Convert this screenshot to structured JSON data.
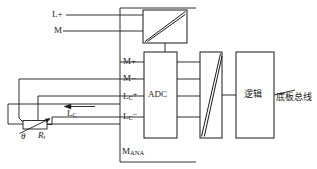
{
  "figure": {
    "kind": "electrical-schematic",
    "background_color": "#ffffff",
    "line_color": "#1a1a1a"
  },
  "blocks": {
    "power_isolation": {
      "label": "",
      "symbol": "diagonal-isolation",
      "x": 143,
      "y": 10,
      "w": 44,
      "h": 33
    },
    "adc": {
      "label": "ADC",
      "x": 144,
      "y": 52,
      "w": 33,
      "h": 86
    },
    "signal_isolation": {
      "label": "",
      "symbol": "diagonal-isolation",
      "x": 200,
      "y": 52,
      "w": 22,
      "h": 86
    },
    "logic": {
      "label": "逻辑",
      "x": 236,
      "y": 52,
      "w": 38,
      "h": 86
    }
  },
  "supply_terminals": [
    {
      "name": "l-plus",
      "label": "L+",
      "x": 52,
      "y": 10
    },
    {
      "name": "m-ground",
      "label": "M",
      "x": 52,
      "y": 26
    }
  ],
  "adc_terminals": [
    {
      "name": "m-plus",
      "label": "M+",
      "sup": "",
      "sub": "",
      "x": 120,
      "y": 57
    },
    {
      "name": "m-minus",
      "label": "M−",
      "sup": "",
      "sub": "",
      "x": 120,
      "y": 74
    },
    {
      "name": "lc-plus",
      "label": "L",
      "sub": "C",
      "sup": "+",
      "x": 120,
      "y": 91
    },
    {
      "name": "lc-minus",
      "label": "L",
      "sub": "C",
      "sup": "−",
      "x": 120,
      "y": 111
    }
  ],
  "labels": {
    "analog_ground": {
      "base": "M",
      "sub": "ANA",
      "x": 122,
      "y": 147
    },
    "current_arrow": {
      "base": "L",
      "sub": "C",
      "x": 67,
      "y": 113
    },
    "backplane_bus": {
      "text": "底板总线",
      "x": 276,
      "y": 93
    },
    "theta": {
      "text": "θ",
      "x": 23,
      "y": 133
    },
    "rt": {
      "base": "R",
      "sub": "t",
      "x": 39,
      "y": 132
    }
  },
  "sensor": {
    "name": "rtd-thermistor",
    "type": "variable-resistor",
    "body": {
      "x": 23,
      "y": 120,
      "w": 24,
      "h": 9
    }
  },
  "colors": {
    "line": "#1a1a1a",
    "text": "#1a1a1a",
    "background": "#ffffff"
  }
}
